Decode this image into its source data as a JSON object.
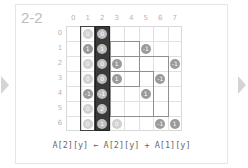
{
  "slide": {
    "title": "2-2",
    "nav": {
      "prev_icon": "triangle-left-icon",
      "next_icon": "triangle-right-icon"
    },
    "formula": "A[2][y] ← A[2][y] + A[1][y]"
  },
  "grid": {
    "columns": [
      "0",
      "1",
      "2",
      "3",
      "4",
      "5",
      "6",
      "7"
    ],
    "rows": [
      "0",
      "1",
      "2",
      "3",
      "4",
      "5",
      "6"
    ],
    "highlighted_columns": [
      {
        "index": 1,
        "style": "outlined"
      },
      {
        "index": 2,
        "style": "filled-dark"
      }
    ],
    "cells": [
      {
        "row": 0,
        "col": 1,
        "value": "0",
        "tone": "light"
      },
      {
        "row": 1,
        "col": 1,
        "value": "1",
        "tone": "dark"
      },
      {
        "row": 2,
        "col": 1,
        "value": "0",
        "tone": "light"
      },
      {
        "row": 3,
        "col": 1,
        "value": "0",
        "tone": "light"
      },
      {
        "row": 4,
        "col": 1,
        "value": "-1",
        "tone": "dark"
      },
      {
        "row": 5,
        "col": 1,
        "value": "0",
        "tone": "light"
      },
      {
        "row": 6,
        "col": 1,
        "value": "0",
        "tone": "light"
      },
      {
        "row": 0,
        "col": 2,
        "value": "0",
        "tone": "col2"
      },
      {
        "row": 1,
        "col": 2,
        "value": "1",
        "tone": "col2"
      },
      {
        "row": 2,
        "col": 2,
        "value": "0",
        "tone": "col2"
      },
      {
        "row": 3,
        "col": 2,
        "value": "0",
        "tone": "col2"
      },
      {
        "row": 4,
        "col": 2,
        "value": "-1",
        "tone": "col2"
      },
      {
        "row": 5,
        "col": 2,
        "value": "2",
        "tone": "col2"
      },
      {
        "row": 6,
        "col": 2,
        "value": "1",
        "tone": "col2"
      },
      {
        "row": 1,
        "col": 5,
        "value": "-1",
        "tone": "dark"
      },
      {
        "row": 2,
        "col": 3,
        "value": "1",
        "tone": "dark"
      },
      {
        "row": 2,
        "col": 7,
        "value": "-1",
        "tone": "dark"
      },
      {
        "row": 3,
        "col": 3,
        "value": "1",
        "tone": "dark"
      },
      {
        "row": 3,
        "col": 6,
        "value": "-1",
        "tone": "dark"
      },
      {
        "row": 4,
        "col": 5,
        "value": "1",
        "tone": "dark"
      },
      {
        "row": 6,
        "col": 3,
        "value": "0",
        "tone": "light"
      },
      {
        "row": 6,
        "col": 6,
        "value": "-1",
        "tone": "dark"
      },
      {
        "row": 6,
        "col": 7,
        "value": "1",
        "tone": "dark"
      }
    ],
    "rectangles": [
      {
        "top_row": 1,
        "left_col": 3,
        "bottom_row": 3,
        "right_col": 4
      },
      {
        "top_row": 2,
        "left_col": 3,
        "bottom_row": 5,
        "right_col": 6
      },
      {
        "top_row": 3,
        "left_col": 3,
        "bottom_row": 5,
        "right_col": 5
      }
    ]
  },
  "colors": {
    "grid_line": "#e0e0e0",
    "column2_fill": "#3a3a3a",
    "rect_line": "#8f8f8f",
    "title": "#bdbdbd"
  }
}
